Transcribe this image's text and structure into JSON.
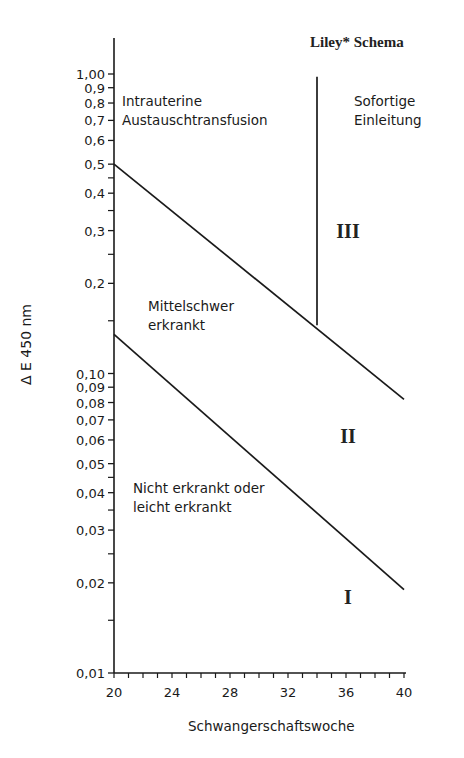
{
  "chart_data": {
    "type": "line",
    "title": "Liley* Schema",
    "xlabel": "Schwangerschaftswoche",
    "ylabel": "Δ E 450 nm",
    "xlim": [
      20,
      40
    ],
    "ylim": [
      0.01,
      1.0
    ],
    "yscale": "log",
    "grid": false,
    "x_ticks": [
      "20",
      "24",
      "28",
      "32",
      "36",
      "40"
    ],
    "y_ticks": [
      "1,00",
      "0,9",
      "0,8",
      "0,7",
      "0,6",
      "0,5",
      "0,4",
      "0,3",
      "0,2",
      "0,10",
      "0,09",
      "0,08",
      "0,07",
      "0,06",
      "0,05",
      "0,04",
      "0,03",
      "0,02",
      "0,01"
    ],
    "series": [
      {
        "name": "Upper boundary (Zone II/III)",
        "x": [
          20,
          40
        ],
        "y": [
          0.5,
          0.082
        ]
      },
      {
        "name": "Lower boundary (Zone I/II)",
        "x": [
          20,
          40
        ],
        "y": [
          0.135,
          0.019
        ]
      },
      {
        "name": "Vertical divider (34 weeks)",
        "x": [
          34,
          34
        ],
        "y": [
          0.145,
          0.98
        ]
      }
    ],
    "annotations": [
      {
        "text": "Intrauterine Austauschtransfusion",
        "region": "upper-left"
      },
      {
        "text": "Sofortige Einleitung",
        "region": "upper-right"
      },
      {
        "text": "Mittelschwer erkrankt",
        "region": "middle"
      },
      {
        "text": "Nicht erkrankt oder leicht erkrankt",
        "region": "lower"
      },
      {
        "text": "III",
        "x": 36,
        "y": 0.3
      },
      {
        "text": "II",
        "x": 36,
        "y": 0.062
      },
      {
        "text": "I",
        "x": 36,
        "y": 0.018
      }
    ]
  },
  "labels": {
    "title": "Liley* Schema",
    "ylabel": "Δ E   450 nm",
    "xlabel": "Schwangerschaftswoche",
    "region_iat": "Intrauterine\nAustauschtransfusion",
    "region_sofort": "Sofortige\nEinleitung",
    "region_mittel": "Mittelschwer\nerkrankt",
    "region_nicht": "Nicht erkrankt oder\nleicht erkrankt",
    "zone_3": "III",
    "zone_2": "II",
    "zone_1": "I"
  },
  "axis": {
    "x_ticks": [
      "20",
      "24",
      "28",
      "32",
      "36",
      "40"
    ],
    "y_ticks": [
      {
        "label": "1,00",
        "v": 1.0
      },
      {
        "label": "0,9",
        "v": 0.9
      },
      {
        "label": "0,8",
        "v": 0.8
      },
      {
        "label": "0,7",
        "v": 0.7
      },
      {
        "label": "0,6",
        "v": 0.6
      },
      {
        "label": "0,5",
        "v": 0.5
      },
      {
        "label": "0,4",
        "v": 0.4
      },
      {
        "label": "0,3",
        "v": 0.3
      },
      {
        "label": "0,2",
        "v": 0.2
      },
      {
        "label": "0,10",
        "v": 0.1
      },
      {
        "label": "0,09",
        "v": 0.09
      },
      {
        "label": "0,08",
        "v": 0.08
      },
      {
        "label": "0,07",
        "v": 0.07
      },
      {
        "label": "0,06",
        "v": 0.06
      },
      {
        "label": "0,05",
        "v": 0.05
      },
      {
        "label": "0,04",
        "v": 0.04
      },
      {
        "label": "0,03",
        "v": 0.03
      },
      {
        "label": "0,02",
        "v": 0.02
      },
      {
        "label": "0,01",
        "v": 0.01
      }
    ],
    "y_minor": [
      0.45,
      0.35,
      0.25,
      0.15,
      0.045,
      0.035,
      0.025,
      0.015
    ]
  }
}
